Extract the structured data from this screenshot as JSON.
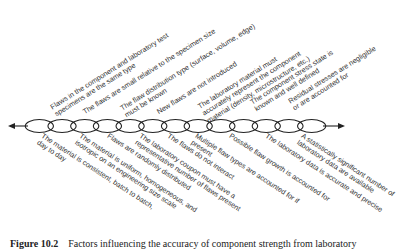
{
  "figure": {
    "caption_label": "Figure 10.2",
    "caption_text": "Factors influencing the accuracy of component strength from laboratory"
  },
  "chain": {
    "color": "#222222",
    "link_count": 13,
    "arrows": [
      "left",
      "right"
    ]
  },
  "labels_above": [
    {
      "lines": [
        "Flaws in the component and laboratory test",
        "specimens are the same type"
      ]
    },
    {
      "lines": [
        "The flaws are small relative to the specimen size"
      ]
    },
    {
      "lines": [
        "The flaw distribution type (surface, volume, edge)",
        "must be known"
      ]
    },
    {
      "lines": [
        "New flaws are not introduced"
      ]
    },
    {
      "lines": [
        "The laboratory material must",
        "accurately represent the component",
        "material (density, microstructure, etc.)"
      ]
    },
    {
      "lines": [
        "The component stress state is",
        "known and well defined"
      ]
    },
    {
      "lines": [
        "Residual stresses are negligible",
        "or are accounted for"
      ]
    }
  ],
  "labels_below": [
    {
      "lines": [
        "The material is consistent, batch to batch,",
        "day to day"
      ]
    },
    {
      "lines": [
        "The material is uniform, homogeneous, and",
        "isotropic on an engineering size scale"
      ]
    },
    {
      "lines": [
        "Flaws are randomly distributed"
      ]
    },
    {
      "lines": [
        "The laboratory coupon must have a",
        "representative number of flaws present"
      ]
    },
    {
      "lines": [
        "The flaws do not interact"
      ]
    },
    {
      "lines": [
        "Multiple flaw types are accounted for if",
        "present"
      ]
    },
    {
      "lines": [
        "Possible flaw growth is accounted for"
      ]
    },
    {
      "lines": [
        "The laboratory data is accurate and precise"
      ]
    },
    {
      "lines": [
        "A statistically significant number of",
        "laboratory data are available"
      ]
    }
  ]
}
